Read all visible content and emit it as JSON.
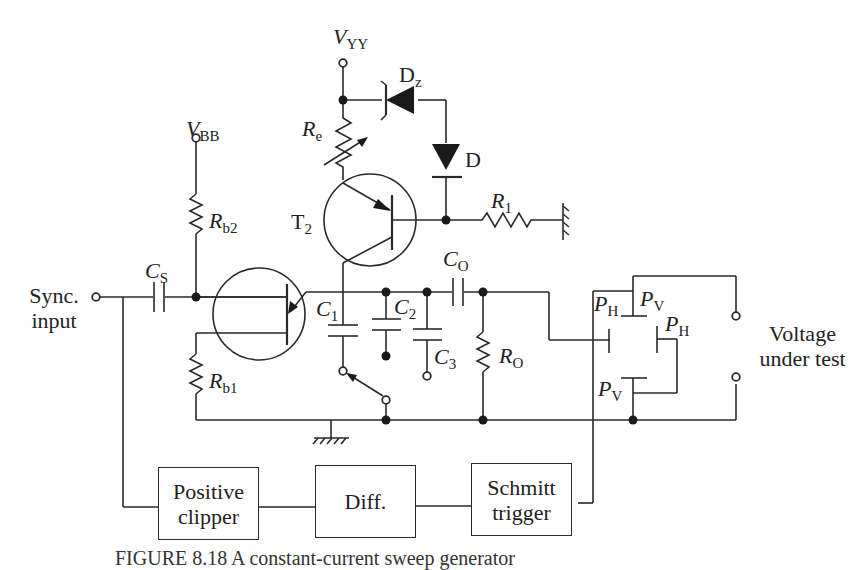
{
  "diagram": {
    "supplies": {
      "vyy": {
        "symbol": "V",
        "subscript": "YY"
      },
      "vbb": {
        "symbol": "V",
        "subscript": "BB"
      }
    },
    "components": {
      "dz": {
        "symbol": "D",
        "subscript": "z"
      },
      "d": {
        "symbol": "D",
        "subscript": ""
      },
      "re": {
        "symbol": "R",
        "subscript": "e"
      },
      "r1": {
        "symbol": "R",
        "subscript": "1"
      },
      "t2": {
        "symbol": "T",
        "subscript": "2"
      },
      "rb2": {
        "symbol": "R",
        "subscript": "b2"
      },
      "rb1": {
        "symbol": "R",
        "subscript": "b1"
      },
      "cs": {
        "symbol": "C",
        "subscript": "S"
      },
      "c1": {
        "symbol": "C",
        "subscript": "1"
      },
      "c2": {
        "symbol": "C",
        "subscript": "2"
      },
      "c3": {
        "symbol": "C",
        "subscript": "3"
      },
      "co": {
        "symbol": "C",
        "subscript": "O"
      },
      "ro": {
        "symbol": "R",
        "subscript": "O"
      },
      "ph_left": {
        "symbol": "P",
        "subscript": "H"
      },
      "pv_top": {
        "symbol": "P",
        "subscript": "V"
      },
      "ph_right": {
        "symbol": "P",
        "subscript": "H"
      },
      "pv_bottom": {
        "symbol": "P",
        "subscript": "V"
      }
    },
    "terminals": {
      "sync_input": {
        "line1": "Sync.",
        "line2": "input"
      },
      "voltage_under_test": {
        "line1": "Voltage",
        "line2": "under test"
      }
    },
    "blocks": {
      "positive_clipper": {
        "line1": "Positive",
        "line2": "clipper"
      },
      "diff": {
        "line1": "Diff.",
        "line2": ""
      },
      "schmitt_trigger": {
        "line1": "Schmitt",
        "line2": "trigger"
      }
    },
    "caption": "FIGURE 8.18   A constant-current sweep generator"
  }
}
